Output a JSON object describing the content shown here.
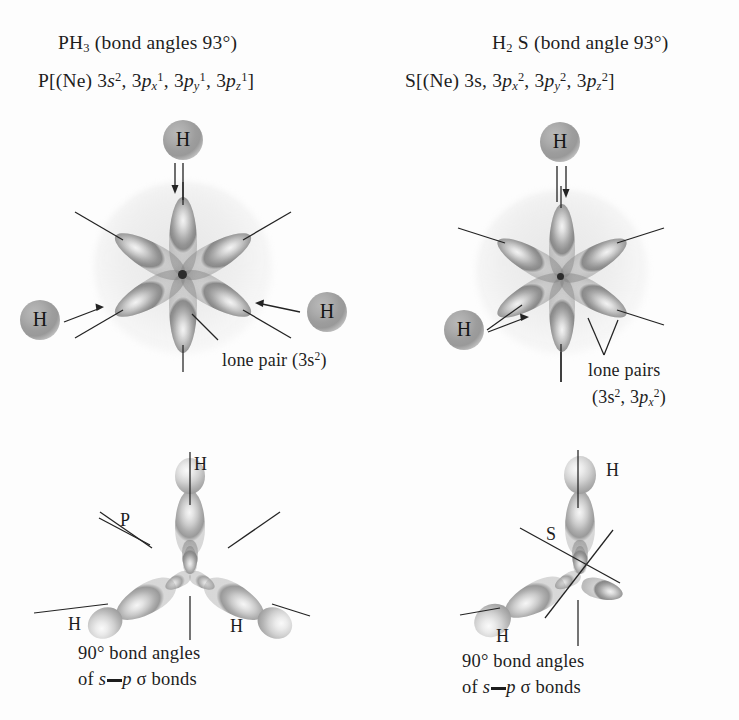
{
  "figure": {
    "background_color": "#fdfdfd",
    "ink_color": "#1d1d1d",
    "orbital_color": "#9a9a9a",
    "atom_sphere_color": "#a0a0a0"
  },
  "panels": {
    "left": {
      "title_molecule": "PH",
      "title_molecule_sub": "3",
      "title_angle": "(bond angles 93°)",
      "config_prefix": "P[(Ne) 3",
      "config_s": "s",
      "config_s_sup": "2",
      "config_sep1": ", 3",
      "config_p1": "p",
      "config_p1_sub": "x",
      "config_p1_sup": "1",
      "config_sep2": ", 3",
      "config_p2": "p",
      "config_p2_sub": "y",
      "config_p2_sup": "1",
      "config_sep3": ", 3",
      "config_p3": "p",
      "config_p3_sub": "z",
      "config_p3_sup": "1",
      "config_suffix": "]",
      "atom_labels": [
        "H",
        "H",
        "H"
      ],
      "lone_pair_label": "lone pair (3s",
      "lone_pair_sup": "2",
      "lone_pair_close": ")",
      "center_atom_label": "P",
      "bottom_atom_labels": [
        "H",
        "H",
        "H"
      ],
      "caption_line1": "90° bond angles",
      "caption_line2_a": "of ",
      "caption_line2_s": "s",
      "caption_line2_p": "p",
      "caption_line2_sigma": "σ",
      "caption_line2_b": " bonds"
    },
    "right": {
      "title_molecule": "H",
      "title_molecule_sub": "2",
      "title_molecule_tail": " S",
      "title_angle": "(bond angle 93°)",
      "config_prefix": "S[(Ne) 3s, 3",
      "config_p1": "p",
      "config_p1_sub": "x",
      "config_p1_sup": "2",
      "config_sep2": ", 3",
      "config_p2": "p",
      "config_p2_sub": "y",
      "config_p2_sup": "2",
      "config_sep3": ", 3",
      "config_p3": "p",
      "config_p3_sub": "z",
      "config_p3_sup": "2",
      "config_suffix": "]",
      "atom_labels": [
        "H",
        "H"
      ],
      "lone_pair_label": "lone pairs",
      "lone_pair_detail_open": "(3s",
      "lone_pair_detail_sup1": "2",
      "lone_pair_detail_mid": ", 3",
      "lone_pair_detail_p": "p",
      "lone_pair_detail_sub": "x",
      "lone_pair_detail_sup2": "2",
      "lone_pair_detail_close": ")",
      "center_atom_label": "S",
      "bottom_atom_labels": [
        "H",
        "H"
      ],
      "caption_line1": "90° bond angles",
      "caption_line2_a": "of ",
      "caption_line2_s": "s",
      "caption_line2_p": "p",
      "caption_line2_sigma": "σ",
      "caption_line2_b": " bonds"
    }
  }
}
